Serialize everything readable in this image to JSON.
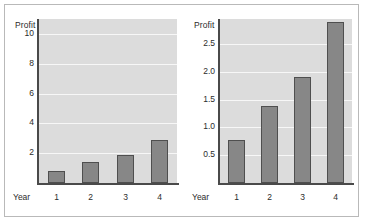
{
  "figure": {
    "background": "#ffffff",
    "border_color": "#b9b9b9",
    "plot_background": "#dcdcdc",
    "gridline_color": "#f7f7f7",
    "bar_fill": "#878787",
    "bar_edge": "#4f4f4f",
    "axis_color": "#4a4a4a",
    "text_color": "#2b2b2b"
  },
  "chart_data": [
    {
      "type": "bar",
      "title": "",
      "ylabel": "Profit",
      "xlabel_prefix": "Year",
      "categories": [
        "1",
        "2",
        "3",
        "4"
      ],
      "values": [
        0.78,
        1.38,
        1.9,
        2.9
      ],
      "ylim": [
        0,
        11
      ],
      "yticks": [
        2,
        4,
        6,
        8,
        10
      ],
      "ytick_labels": [
        "2",
        "4",
        "6",
        "8",
        "10"
      ],
      "grid": true,
      "legend": "none"
    },
    {
      "type": "bar",
      "title": "",
      "ylabel": "Profit",
      "xlabel_prefix": "Year",
      "categories": [
        "1",
        "2",
        "3",
        "4"
      ],
      "values": [
        0.78,
        1.38,
        1.9,
        2.9
      ],
      "ylim": [
        0,
        2.95
      ],
      "yticks": [
        0.5,
        1.0,
        1.5,
        2.0,
        2.5
      ],
      "ytick_labels": [
        "0.5",
        "1.0",
        "1.5",
        "2.0",
        "2.5"
      ],
      "grid": true,
      "legend": "none"
    }
  ]
}
